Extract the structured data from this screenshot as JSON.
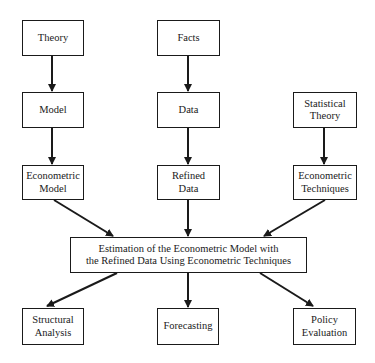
{
  "diagram": {
    "nodes": {
      "theory": "Theory",
      "facts": "Facts",
      "model": "Model",
      "data": "Data",
      "statistical_theory": "Statistical\nTheory",
      "econometric_model": "Econometric\nModel",
      "refined_data": "Refined\nData",
      "econometric_techniques": "Econometric\nTechniques",
      "estimation": "Estimation of the Econometric Model with\nthe Refined Data Using Econometric Techniques",
      "structural_analysis": "Structural\nAnalysis",
      "forecasting": "Forecasting",
      "policy_evaluation": "Policy\nEvaluation"
    },
    "edges": [
      [
        "theory",
        "model"
      ],
      [
        "facts",
        "data"
      ],
      [
        "model",
        "econometric_model"
      ],
      [
        "data",
        "refined_data"
      ],
      [
        "statistical_theory",
        "econometric_techniques"
      ],
      [
        "econometric_model",
        "estimation"
      ],
      [
        "refined_data",
        "estimation"
      ],
      [
        "econometric_techniques",
        "estimation"
      ],
      [
        "estimation",
        "structural_analysis"
      ],
      [
        "estimation",
        "forecasting"
      ],
      [
        "estimation",
        "policy_evaluation"
      ]
    ]
  }
}
